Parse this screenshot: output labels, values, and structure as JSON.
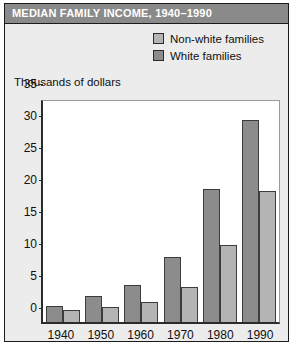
{
  "title": "MEDIAN FAMILY INCOME, 1940–1990",
  "legend": {
    "items": [
      {
        "label": "Non-white families",
        "color": "#b4b4b4",
        "swatch_icon": "legend-swatch-icon"
      },
      {
        "label": "White families",
        "color": "#8c8c8c",
        "swatch_icon": "legend-swatch-icon"
      }
    ]
  },
  "colors": {
    "title_bar": "#8a8a8a",
    "card_background": "#ececec",
    "plot_background": "#ffffff",
    "axis": "#2b2b2b",
    "non_white": "#b4b4b4",
    "white": "#8c8c8c"
  },
  "caption": "",
  "chart_data": {
    "type": "bar",
    "title": "MEDIAN FAMILY INCOME, 1940–1990",
    "subtitle": "",
    "xlabel": "",
    "ylabel": "Thousands of dollars",
    "categories": [
      "1940",
      "1950",
      "1960",
      "1970",
      "1980",
      "1990"
    ],
    "series": [
      {
        "name": "White families",
        "color": "#8c8c8c",
        "values": [
          2.5,
          4.1,
          5.8,
          10.2,
          20.8,
          31.5
        ]
      },
      {
        "name": "Non-white families",
        "color": "#b4b4b4",
        "values": [
          1.8,
          2.4,
          3.2,
          5.5,
          12.0,
          20.5
        ]
      }
    ],
    "ylim": [
      0,
      35
    ],
    "yticks": [
      0,
      5,
      10,
      15,
      20,
      25,
      30,
      35
    ],
    "ytick_labels": [
      "0",
      "5",
      "10",
      "15",
      "20",
      "25",
      "30",
      "35"
    ],
    "grid": false,
    "legend_position": "top-right",
    "bar_order": "white-families-left, non-white-families-right"
  }
}
